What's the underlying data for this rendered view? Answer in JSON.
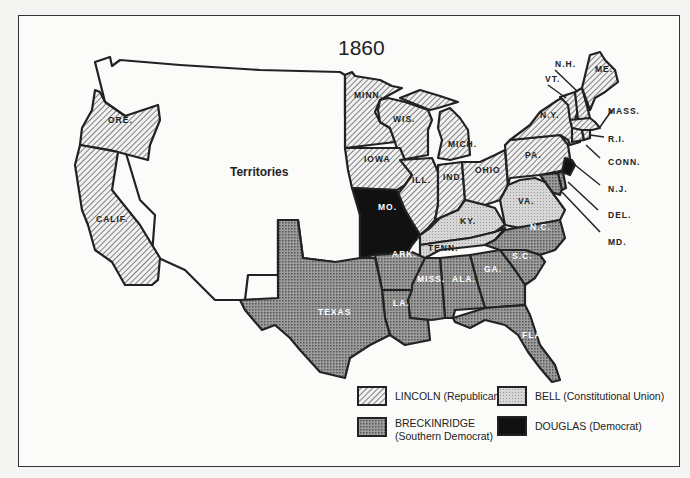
{
  "map": {
    "title": "1860",
    "territories_label": "Territories",
    "colors": {
      "lincoln": "#d8d8d8",
      "bell": "#c8c8c8",
      "breckinridge": "#8f8f8f",
      "douglas": "#111111",
      "border": "#222222"
    },
    "states": {
      "ore": "ORE.",
      "calif": "CALIF.",
      "minn": "MINN.",
      "wis": "WIS.",
      "iowa": "IOWA",
      "mich": "MICH.",
      "ill": "ILL.",
      "ind": "IND.",
      "ohio": "OHIO",
      "pa": "PA.",
      "ny": "N.Y.",
      "vt": "VT.",
      "nh": "N.H.",
      "me": "ME.",
      "mass": "MASS.",
      "ri": "R.I.",
      "conn": "CONN.",
      "nj": "N.J.",
      "del": "DEL.",
      "md": "MD.",
      "mo": "MO.",
      "ky": "KY.",
      "va": "VA.",
      "tenn": "TENN.",
      "nc": "N.C.",
      "sc": "S.C.",
      "ga": "GA.",
      "ala": "ALA.",
      "miss": "MISS.",
      "ark": "ARK.",
      "la": "LA.",
      "texas": "TEXAS",
      "fla": "FLA."
    }
  },
  "legend": {
    "lincoln": "LINCOLN  (Republican)",
    "bell": "BELL  (Constitutional Union)",
    "breckinridge_1": "BRECKINRIDGE",
    "breckinridge_2": "(Southern Democrat)",
    "douglas": "DOUGLAS  (Democrat)"
  }
}
